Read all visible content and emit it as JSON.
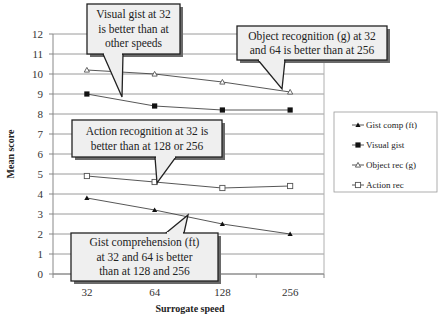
{
  "chart_data": {
    "type": "line",
    "title": "",
    "xlabel": "Surrogate speed",
    "ylabel": "Mean score",
    "categories": [
      "32",
      "64",
      "128",
      "256"
    ],
    "ylim": [
      0,
      12
    ],
    "yticks": [
      "0",
      "1",
      "2",
      "3",
      "4",
      "5",
      "6",
      "7",
      "8",
      "9",
      "10",
      "11",
      "12"
    ],
    "grid": true,
    "legend_position": "right",
    "series": [
      {
        "name": "Gist comp (ft)",
        "marker": "filled-triangle",
        "values": [
          3.8,
          3.2,
          2.5,
          2.0
        ]
      },
      {
        "name": "Visual gist",
        "marker": "filled-square",
        "values": [
          9.0,
          8.4,
          8.2,
          8.2
        ]
      },
      {
        "name": "Object rec (g)",
        "marker": "open-triangle",
        "values": [
          10.2,
          10.0,
          9.6,
          9.1
        ]
      },
      {
        "name": "Action rec",
        "marker": "open-square",
        "values": [
          4.9,
          4.6,
          4.3,
          4.4
        ]
      }
    ],
    "annotations": [
      {
        "id": "visual",
        "lines": [
          "Visual gist at 32",
          "is better than at",
          "other speeds"
        ]
      },
      {
        "id": "object",
        "lines": [
          "Object recognition (g) at 32",
          "and 64 is better than at 256"
        ]
      },
      {
        "id": "action",
        "lines": [
          "Action recognition at 32 is",
          "better than at 128 or 256"
        ]
      },
      {
        "id": "gist",
        "lines": [
          "Gist comprehension (ft)",
          "at 32 and 64 is better",
          "than at 128 and 256"
        ]
      }
    ]
  }
}
